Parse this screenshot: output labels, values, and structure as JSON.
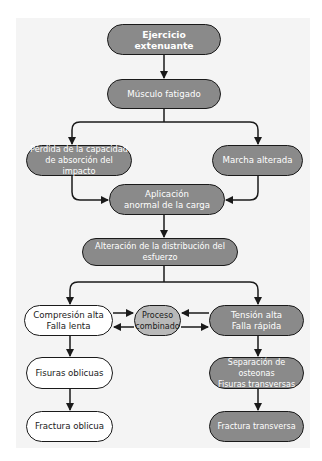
{
  "diagram": {
    "type": "flowchart",
    "colors": {
      "dark_node": "#8a8a8a",
      "light_node": "#b9b9b9",
      "white_node": "#ffffff",
      "background": "#f4f4f4",
      "stroke": "#1a1a1a"
    },
    "nodes": {
      "n1": {
        "line1": "Ejercicio extenuante"
      },
      "n2": {
        "line1": "Músculo fatigado"
      },
      "n3": {
        "line1": "Pérdida de la capacidad",
        "line2": "de absorción del impacto"
      },
      "n4": {
        "line1": "Marcha alterada"
      },
      "n5": {
        "line1": "Aplicación",
        "line2": "anormal de la carga"
      },
      "n6": {
        "line1": "Alteración de la distribución del esfuerzo"
      },
      "n7": {
        "line1": "Compresión alta",
        "line2": "Falla lenta"
      },
      "n8": {
        "line1": "Proceso",
        "line2": "combinado"
      },
      "n9": {
        "line1": "Tensión alta",
        "line2": "Falla rápida"
      },
      "n10": {
        "line1": "Fisuras oblicuas"
      },
      "n11": {
        "line1": "Separación de osteonas",
        "line2": "Fisuras transversas"
      },
      "n12": {
        "line1": "Fractura oblicua"
      },
      "n13": {
        "line1": "Fractura transversa"
      }
    },
    "edges": [
      [
        "n1",
        "n2"
      ],
      [
        "n2",
        "n3"
      ],
      [
        "n2",
        "n4"
      ],
      [
        "n3",
        "n5"
      ],
      [
        "n4",
        "n5"
      ],
      [
        "n5",
        "n6"
      ],
      [
        "n6",
        "n7"
      ],
      [
        "n6",
        "n9"
      ],
      [
        "n7",
        "n8"
      ],
      [
        "n8",
        "n7"
      ],
      [
        "n9",
        "n8"
      ],
      [
        "n8",
        "n9"
      ],
      [
        "n7",
        "n10"
      ],
      [
        "n10",
        "n12"
      ],
      [
        "n9",
        "n11"
      ],
      [
        "n11",
        "n13"
      ]
    ]
  }
}
